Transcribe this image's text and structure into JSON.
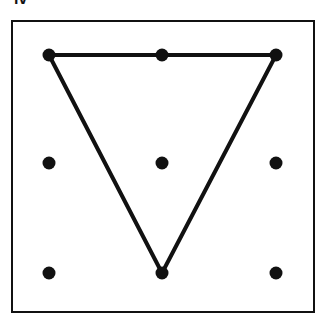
{
  "figure": {
    "label_fragment": "iv",
    "grid": {
      "columns_x": [
        49,
        162,
        276
      ],
      "rows_y": [
        55,
        163,
        273
      ],
      "dot_radius": 6.5,
      "dot_color": "#111111"
    },
    "triangle": {
      "vertices": [
        [
          49,
          55
        ],
        [
          276,
          55
        ],
        [
          162,
          273
        ]
      ],
      "stroke": "#111111",
      "stroke_width": 4
    },
    "frame": {
      "stroke": "#111111"
    }
  }
}
